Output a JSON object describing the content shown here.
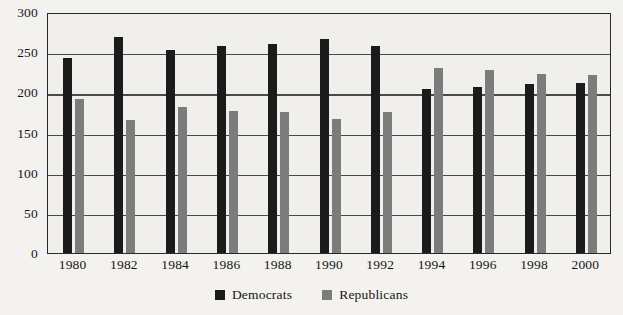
{
  "chart_data": {
    "type": "bar",
    "title": "",
    "subtitle": "",
    "xlabel": "",
    "ylabel": "",
    "categories": [
      "1980",
      "1982",
      "1984",
      "1986",
      "1988",
      "1990",
      "1992",
      "1994",
      "1996",
      "1998",
      "2000"
    ],
    "series": [
      {
        "name": "Democrats",
        "color": "#1b1b1b",
        "values": [
          243,
          269,
          253,
          258,
          260,
          267,
          258,
          204,
          207,
          211,
          212
        ]
      },
      {
        "name": "Republicans",
        "color": "#7c7c7c",
        "values": [
          192,
          166,
          182,
          177,
          175,
          167,
          176,
          230,
          228,
          223,
          221
        ]
      }
    ],
    "ylim": [
      0,
      300
    ],
    "yticks": [
      "0",
      "50",
      "100",
      "150",
      "200",
      "250",
      "300"
    ],
    "ytick_values": [
      0,
      50,
      100,
      150,
      200,
      250,
      300
    ],
    "grid": true,
    "grid_axis": "y",
    "legend_position": "bottom-center",
    "legend": [
      "Democrats",
      "Republicans"
    ],
    "background_color": "#f4f2ee",
    "plot_background_color": "#f1efec",
    "frame_color": "#2a2a2a"
  }
}
